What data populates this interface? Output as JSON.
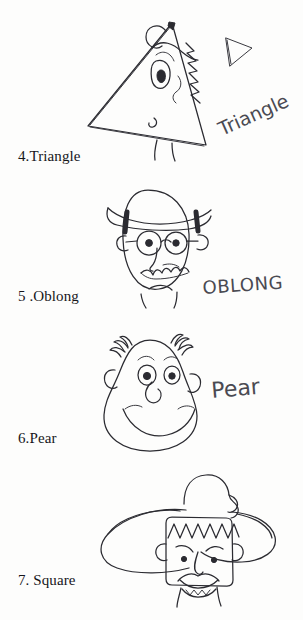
{
  "page": {
    "kind": "scanned-worksheet-page",
    "background_color": "#fdfdfc",
    "ink_color": "#2b2b31",
    "handwriting_color": "#4a4a52"
  },
  "figures": [
    {
      "number": "4",
      "caption": "4.Triangle",
      "shape_name": "Triangle",
      "handwritten_label": "Triangle",
      "has_shape_icon": true,
      "icon_name": "triangle-outline-icon",
      "description": "Side-view triangular cartoon head with one eye, curl loop at apex, jagged spiky back edge, small nose and two legs"
    },
    {
      "number": "5",
      "caption": "5 .Oblong",
      "shape_name": "Oblong",
      "handwritten_label": "OBLONG",
      "has_shape_icon": false,
      "icon_name": "",
      "description": "Oblong cartoon head wearing a wide brim hat, round spectacles, bushy moustache and a frowning mouth"
    },
    {
      "number": "6",
      "caption": "6.Pear",
      "shape_name": "Pear",
      "handwritten_label": "Pear",
      "has_shape_icon": false,
      "icon_name": "",
      "description": "Pear shaped cartoon head, narrow at the top and wide at the jaw, tufts of hair at the temples, broad smile"
    },
    {
      "number": "7",
      "caption": "7. Square",
      "shape_name": "Square",
      "handwritten_label": "",
      "has_shape_icon": false,
      "icon_name": "",
      "description": "Square cartoon head under a large sombrero style hat, zigzag hairline, moustache and wavy mouth"
    }
  ]
}
